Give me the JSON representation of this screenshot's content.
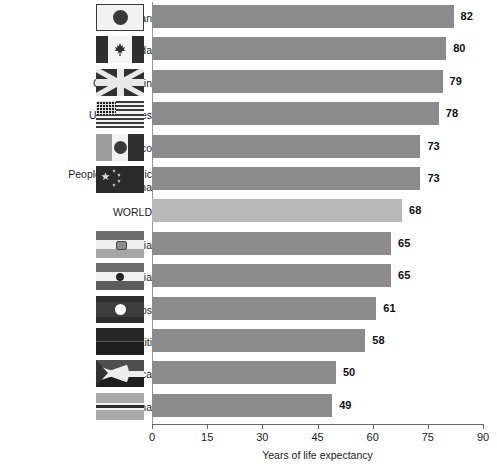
{
  "chart_data": {
    "type": "bar",
    "orientation": "horizontal",
    "title": "",
    "xlabel": "Years of life expectancy",
    "ylabel": "",
    "xlim": [
      0,
      90
    ],
    "xticks": [
      0,
      15,
      30,
      45,
      60,
      75,
      90
    ],
    "grid": false,
    "legend": "none",
    "categories": [
      "Japan",
      "Canada",
      "Great Britain",
      "United States",
      "Mexico",
      "People's Republic of China",
      "WORLD",
      "Bolivia",
      "India",
      "Laos",
      "Haiti",
      "South Africa",
      "Botswana"
    ],
    "values": [
      82,
      80,
      79,
      78,
      73,
      73,
      68,
      65,
      65,
      61,
      58,
      50,
      49
    ],
    "highlight_category": "WORLD",
    "colors": {
      "bar": "#8b8b8b",
      "bar_highlight": "#b8b8b8",
      "axis": "#6b6b6b",
      "text": "#1c1c1c"
    }
  },
  "rows": [
    {
      "label": "Japan",
      "label_lines": "Japan",
      "value": 82,
      "flag": "japan-flag",
      "has_flag": true,
      "highlight": false
    },
    {
      "label": "Canada",
      "label_lines": "Canada",
      "value": 80,
      "flag": "canada-flag",
      "has_flag": true,
      "highlight": false
    },
    {
      "label": "Great Britain",
      "label_lines": "Great Britain",
      "value": 79,
      "flag": "great-britain-flag",
      "has_flag": true,
      "highlight": false
    },
    {
      "label": "United States",
      "label_lines": "United States",
      "value": 78,
      "flag": "united-states-flag",
      "has_flag": true,
      "highlight": false
    },
    {
      "label": "Mexico",
      "label_lines": "Mexico",
      "value": 73,
      "flag": "mexico-flag",
      "has_flag": true,
      "highlight": false
    },
    {
      "label": "People's Republic of China",
      "label_lines": "People's Republic\nof China",
      "value": 73,
      "flag": "china-flag",
      "has_flag": true,
      "highlight": false
    },
    {
      "label": "WORLD",
      "label_lines": "WORLD",
      "value": 68,
      "flag": "",
      "has_flag": false,
      "highlight": true
    },
    {
      "label": "Bolivia",
      "label_lines": "Bolivia",
      "value": 65,
      "flag": "bolivia-flag",
      "has_flag": true,
      "highlight": false
    },
    {
      "label": "India",
      "label_lines": "India",
      "value": 65,
      "flag": "india-flag",
      "has_flag": true,
      "highlight": false
    },
    {
      "label": "Laos",
      "label_lines": "Laos",
      "value": 61,
      "flag": "laos-flag",
      "has_flag": true,
      "highlight": false
    },
    {
      "label": "Haiti",
      "label_lines": "Haiti",
      "value": 58,
      "flag": "haiti-flag",
      "has_flag": true,
      "highlight": false
    },
    {
      "label": "South Africa",
      "label_lines": "South Africa",
      "value": 50,
      "flag": "south-africa-flag",
      "has_flag": true,
      "highlight": false
    },
    {
      "label": "Botswana",
      "label_lines": "Botswana",
      "value": 49,
      "flag": "botswana-flag",
      "has_flag": true,
      "highlight": false
    }
  ],
  "axis": {
    "ticks": [
      "0",
      "15",
      "30",
      "45",
      "60",
      "75",
      "90"
    ],
    "title": "Years of life expectancy"
  }
}
